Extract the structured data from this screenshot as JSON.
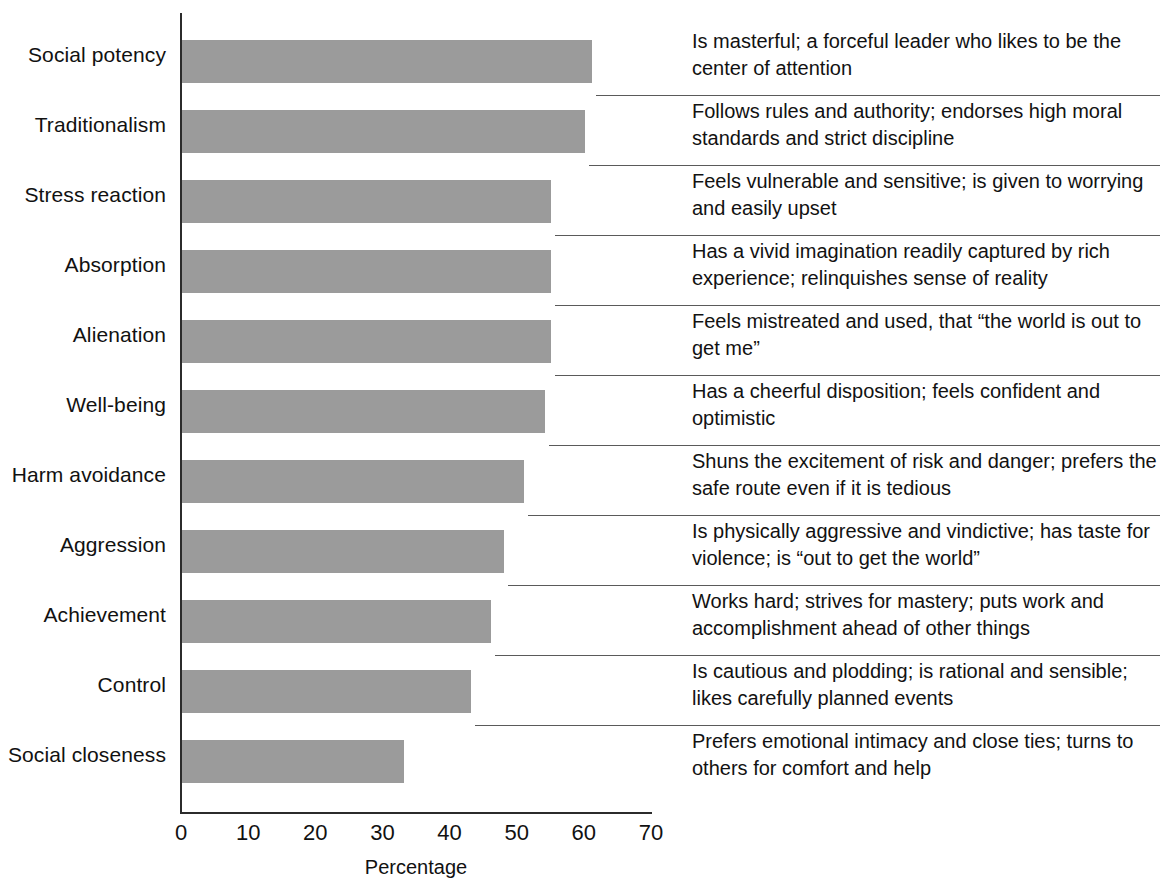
{
  "chart_data": {
    "type": "bar",
    "orientation": "horizontal",
    "title": "",
    "xlabel": "Percentage",
    "ylabel": "",
    "xlim": [
      0,
      70
    ],
    "xticks": [
      0,
      10,
      20,
      30,
      40,
      50,
      60,
      70
    ],
    "grid": false,
    "legend": false,
    "bar_color": "#9b9b9b",
    "axis_color": "#2b2b2b",
    "categories": [
      "Social potency",
      "Traditionalism",
      "Stress reaction",
      "Absorption",
      "Alienation",
      "Well-being",
      "Harm avoidance",
      "Aggression",
      "Achievement",
      "Control",
      "Social closeness"
    ],
    "values": [
      61,
      60,
      55,
      55,
      55,
      54,
      51,
      48,
      46,
      43,
      33
    ],
    "descriptions": [
      "Is masterful; a forceful leader who likes to be the center of attention",
      "Follows rules and authority; endorses high moral standards and strict discipline",
      "Feels vulnerable and sensitive; is given to worrying and easily upset",
      "Has a vivid imagination readily captured by rich experience; relinquishes sense of reality",
      "Feels mistreated and used, that “the world is out to get me”",
      "Has a cheerful disposition; feels confident and optimistic",
      "Shuns the excitement of risk and danger; prefers the safe route even if it is tedious",
      "Is physically aggressive and vindictive; has taste for violence; is “out to get the world”",
      "Works hard; strives for mastery; puts work and accomplishment ahead of other things",
      "Is cautious and plodding; is rational and sensible; likes carefully planned events",
      "Prefers emotional intimacy and close ties; turns to others for comfort and help"
    ]
  }
}
